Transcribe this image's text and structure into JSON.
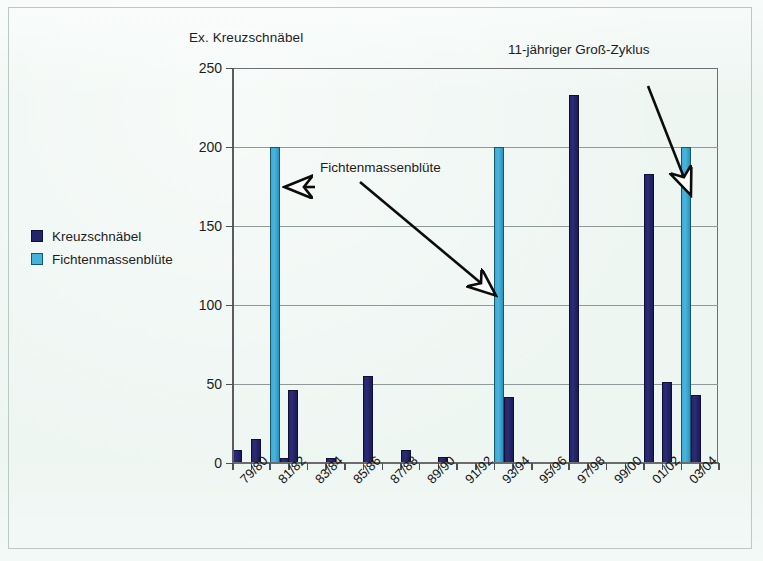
{
  "figure": {
    "y_axis_title": "Ex. Kreuzschnäbel",
    "annotations": [
      {
        "id": "fichten",
        "text": "Fichtenmassenblüte"
      },
      {
        "id": "zyklus",
        "text": "11-jähriger Groß-Zyklus"
      }
    ]
  },
  "legend": {
    "items": [
      {
        "label": "Kreuzschnäbel",
        "color": "#23246a",
        "style": "dark"
      },
      {
        "label": "Fichtenmassenblüte",
        "color": "#45b2db",
        "style": "light"
      }
    ]
  },
  "colors": {
    "series_kreuzschnaebel": "#23246a",
    "series_fichtenmassenbluete": "#45b2db",
    "page_background": "#eef6f2",
    "grid": "#8e9a98",
    "axis": "#5b5b60"
  },
  "chart_data": {
    "type": "bar",
    "title": "",
    "subtitle": "",
    "xlabel": "",
    "ylabel": "Ex. Kreuzschnäbel",
    "ylim": [
      0,
      250
    ],
    "yticks": [
      0,
      50,
      100,
      150,
      200,
      250
    ],
    "grid": "horizontal",
    "legend_position": "left-outside",
    "x_tick_labels": [
      "79/80",
      "81/82",
      "83/84",
      "85/86",
      "87/88",
      "89/90",
      "91/92",
      "93/94",
      "95/96",
      "97/98",
      "99/00",
      "01/02",
      "03/04"
    ],
    "x_tick_label_interval_years": 2,
    "x_tick_count": 26,
    "categories": [
      "79/80",
      "80/81",
      "81/82",
      "82/83",
      "83/84",
      "84/85",
      "85/86",
      "86/87",
      "87/88",
      "88/89",
      "89/90",
      "90/91",
      "91/92",
      "92/93",
      "93/94",
      "94/95",
      "95/96",
      "96/97",
      "97/98",
      "98/99",
      "99/00",
      "00/01",
      "01/02",
      "02/03",
      "03/04",
      "04/05"
    ],
    "series": [
      {
        "name": "Kreuzschnäbel",
        "color": "#23246a",
        "values": [
          8,
          15,
          3,
          46,
          0,
          3,
          0,
          55,
          0,
          8,
          0,
          4,
          0,
          0,
          42,
          0,
          0,
          0,
          233,
          0,
          0,
          0,
          183,
          51,
          43,
          0
        ]
      },
      {
        "name": "Fichtenmassenblüte",
        "color": "#45b2db",
        "note": "indicator bars drawn at full height (200) for mast-flowering years",
        "values": [
          0,
          0,
          200,
          0,
          0,
          0,
          0,
          0,
          0,
          0,
          0,
          0,
          0,
          0,
          200,
          0,
          0,
          0,
          0,
          0,
          0,
          0,
          0,
          0,
          200,
          0
        ],
        "event_years": [
          "81/82",
          "93/94",
          "03/04"
        ]
      }
    ],
    "annotations": [
      {
        "text": "Fichtenmassenblüte",
        "points_to": "81/82",
        "arrow": "left"
      },
      {
        "text": "Fichtenmassenblüte",
        "points_to": "93/94",
        "arrow": "down-left"
      },
      {
        "text": "11-jähriger Groß-Zyklus",
        "points_to": "03/04",
        "arrow": "down-right"
      }
    ]
  }
}
